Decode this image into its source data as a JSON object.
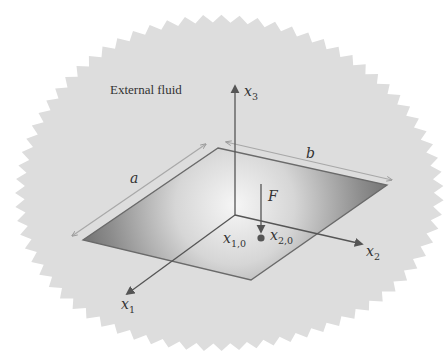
{
  "diagram": {
    "region_label": "External fluid",
    "axes": {
      "x1": {
        "name": "x",
        "sub": "1"
      },
      "x2": {
        "name": "x",
        "sub": "2"
      },
      "x3": {
        "name": "x",
        "sub": "3"
      }
    },
    "dimensions": {
      "a": "a",
      "b": "b"
    },
    "force": {
      "label": "F",
      "position_x1": {
        "name": "x",
        "sub": "1,0"
      },
      "position_x2": {
        "name": "x",
        "sub": "2,0"
      }
    },
    "colors": {
      "fluid": "#dcdcdc",
      "plate_light": "#f2f2f2",
      "plate_dark": "#6e6e6e",
      "line": "#555555",
      "dimension_line": "#a8a8a8",
      "force_dot": "#555555"
    }
  }
}
